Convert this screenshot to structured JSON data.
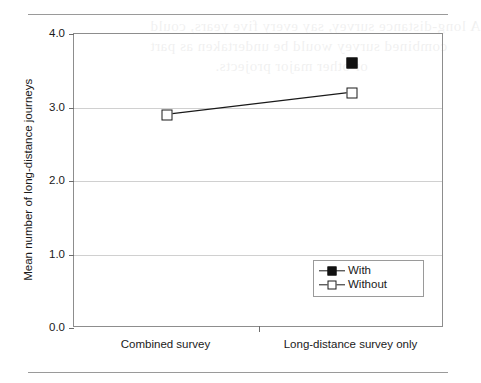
{
  "page": {
    "rule_top": "",
    "rule_bottom": "",
    "ghost_text": [
      "or other major projects.",
      "combined survey would be undertaken as part",
      "A long-distance survey, say every five years, could"
    ]
  },
  "chart_data": {
    "type": "line",
    "title": "",
    "xlabel": "",
    "ylabel": "Mean number of long-distance journeys",
    "categories": [
      "Combined survey",
      "Long-distance survey only"
    ],
    "ylim": [
      0.0,
      4.0
    ],
    "yticks": [
      "0.0",
      "1.0",
      "2.0",
      "3.0",
      "4.0"
    ],
    "ytick_values": [
      0.0,
      1.0,
      2.0,
      3.0,
      4.0
    ],
    "grid": true,
    "legend_position": "lower-right",
    "series": [
      {
        "name": "With",
        "marker": "filled-square",
        "values": [
          null,
          3.6
        ]
      },
      {
        "name": "Without",
        "marker": "open-square",
        "values": [
          2.9,
          3.2
        ]
      }
    ]
  }
}
